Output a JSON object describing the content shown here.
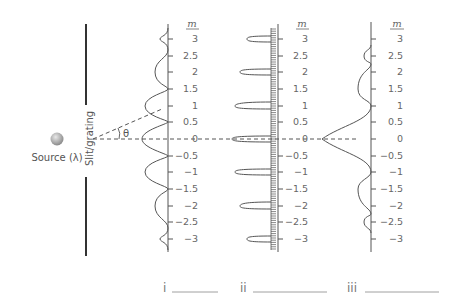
{
  "source": {
    "label": "Source (λ)"
  },
  "slit": {
    "label": "Slit/grating"
  },
  "angle": {
    "label": "θ"
  },
  "axis_header": "m",
  "ticks": [
    {
      "value": 3,
      "label": "3"
    },
    {
      "value": 2.5,
      "label": "2.5"
    },
    {
      "value": 2,
      "label": "2"
    },
    {
      "value": 1.5,
      "label": "1.5"
    },
    {
      "value": 1,
      "label": "1"
    },
    {
      "value": 0.5,
      "label": "0.5"
    },
    {
      "value": 0,
      "label": "0"
    },
    {
      "value": -0.5,
      "label": "−0.5"
    },
    {
      "value": -1,
      "label": "−1"
    },
    {
      "value": -1.5,
      "label": "−1.5"
    },
    {
      "value": -2,
      "label": "−2"
    },
    {
      "value": -2.5,
      "label": "−2.5"
    },
    {
      "value": -3,
      "label": "−3"
    }
  ],
  "panels": [
    {
      "id": "i",
      "label": "i",
      "pattern": "double-slit",
      "axis_x": 168
    },
    {
      "id": "ii",
      "label": "ii",
      "pattern": "diffraction-grating",
      "axis_x": 276
    },
    {
      "id": "iii",
      "label": "iii",
      "pattern": "single-slit",
      "axis_x": 371
    }
  ],
  "answers": [
    {
      "label": "i",
      "value": ""
    },
    {
      "label": "ii",
      "value": ""
    },
    {
      "label": "iii",
      "value": ""
    }
  ],
  "colors": {
    "line": "#555555",
    "text": "#666666",
    "source": "#a9a9a9"
  }
}
